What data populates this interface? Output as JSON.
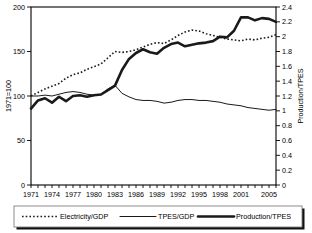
{
  "chart_data": {
    "type": "line",
    "title": "",
    "xlabel": "",
    "ylabel": "1971=100",
    "y2label": "Production/TPES",
    "grid": false,
    "legend_position": "bottom",
    "xlim": [
      1971,
      2006
    ],
    "ylim": [
      0,
      200
    ],
    "y2lim": [
      0,
      2.4
    ],
    "x": [
      1971,
      1972,
      1973,
      1974,
      1975,
      1976,
      1977,
      1978,
      1979,
      1980,
      1981,
      1982,
      1983,
      1984,
      1985,
      1986,
      1987,
      1988,
      1989,
      1990,
      1991,
      1992,
      1993,
      1994,
      1995,
      1996,
      1997,
      1998,
      1999,
      2000,
      2001,
      2002,
      2003,
      2004,
      2005,
      2006
    ],
    "xtick_labels": [
      "1971",
      "1974",
      "1977",
      "1980",
      "1983",
      "1986",
      "1989",
      "1992",
      "1995",
      "1998",
      "2001",
      "2005"
    ],
    "ytick_labels": [
      "0",
      "50",
      "100",
      "150",
      "200"
    ],
    "ytick_values": [
      0,
      50,
      100,
      150,
      200
    ],
    "y2tick_labels": [
      "0",
      "0.2",
      "0.4",
      "0.6",
      "0.8",
      "1",
      "1.2",
      "1.4",
      "1.6",
      "1.8",
      "2",
      "2.2",
      "2.4"
    ],
    "y2tick_values": [
      0,
      0.2,
      0.4,
      0.6,
      0.8,
      1.0,
      1.2,
      1.4,
      1.6,
      1.8,
      2.0,
      2.2,
      2.4
    ],
    "series": [
      {
        "name": "Electricity/GDP",
        "axis": "left",
        "style": "dotted",
        "values": [
          100,
          104,
          108,
          111,
          114,
          120,
          124,
          126,
          130,
          133,
          136,
          143,
          150,
          149,
          150,
          152,
          155,
          158,
          160,
          159,
          163,
          168,
          172,
          174,
          173,
          170,
          168,
          166,
          164,
          163,
          162,
          164,
          163,
          165,
          166,
          169
        ]
      },
      {
        "name": "TPES/GDP",
        "axis": "left",
        "style": "thin",
        "values": [
          100,
          100,
          101,
          100,
          102,
          104,
          105,
          104,
          102,
          101,
          102,
          108,
          112,
          103,
          99,
          96,
          95,
          95,
          94,
          92,
          93,
          95,
          96,
          96,
          95,
          95,
          94,
          93,
          91,
          90,
          89,
          87,
          86,
          85,
          84,
          85
        ]
      },
      {
        "name": "Production/TPES",
        "axis": "right",
        "style": "thick",
        "values": [
          1.03,
          1.14,
          1.17,
          1.11,
          1.19,
          1.13,
          1.2,
          1.21,
          1.19,
          1.21,
          1.22,
          1.28,
          1.34,
          1.55,
          1.7,
          1.78,
          1.83,
          1.79,
          1.77,
          1.85,
          1.9,
          1.92,
          1.87,
          1.89,
          1.91,
          1.92,
          1.94,
          2.0,
          1.99,
          2.08,
          2.26,
          2.26,
          2.22,
          2.25,
          2.24,
          2.2
        ]
      }
    ]
  },
  "legend": {
    "items": [
      {
        "label": "Electricity/GDP",
        "style": "dotted"
      },
      {
        "label": "TPES/GDP",
        "style": "thin"
      },
      {
        "label": "Production/TPES",
        "style": "thick"
      }
    ]
  }
}
